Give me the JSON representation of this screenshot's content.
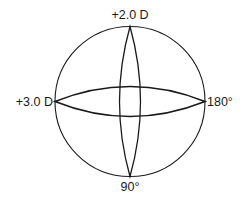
{
  "diagram": {
    "type": "power-cross",
    "labels": {
      "top": "+2.0 D",
      "left": "+3.0 D",
      "right": "180°",
      "bottom": "90°"
    },
    "meridians": [
      {
        "axis": "vertical",
        "meridian_deg": "90°",
        "power": "+2.0 D"
      },
      {
        "axis": "horizontal",
        "meridian_deg": "180°",
        "power": "+3.0 D"
      }
    ],
    "colors": {
      "stroke": "#1a1a1a",
      "background": "#ffffff"
    }
  }
}
